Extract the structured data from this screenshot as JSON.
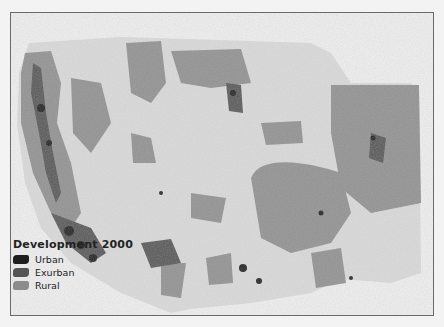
{
  "map": {
    "title": "Development 2000",
    "region": "Southwestern United States",
    "colors": {
      "background": "#ececec",
      "relief_light": "#dcdcdc",
      "urban": "#1e1e1e",
      "exurban": "#555555",
      "rural": "#8c8c8c"
    }
  },
  "legend": {
    "title": "Development 2000",
    "items": [
      {
        "label": "Urban",
        "color": "#1e1e1e"
      },
      {
        "label": "Exurban",
        "color": "#555555"
      },
      {
        "label": "Rural",
        "color": "#8c8c8c"
      }
    ]
  }
}
